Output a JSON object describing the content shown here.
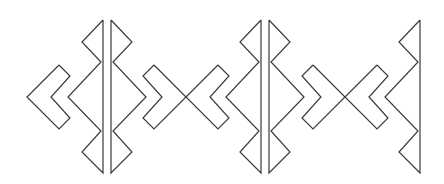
{
  "figure": {
    "stroke_color": "#3a3a3a",
    "background_color": "#ffffff",
    "motifs": [
      {
        "name": "left-chevron",
        "type": "chevron"
      },
      {
        "name": "tall-split-diamond-1",
        "type": "split-zigzag-column"
      },
      {
        "name": "x-cross-1",
        "type": "crossed-chevrons"
      },
      {
        "name": "tall-split-diamond-2",
        "type": "split-zigzag-column"
      },
      {
        "name": "x-cross-2",
        "type": "crossed-chevrons"
      },
      {
        "name": "right-half-column",
        "type": "half-zigzag-column"
      }
    ]
  }
}
